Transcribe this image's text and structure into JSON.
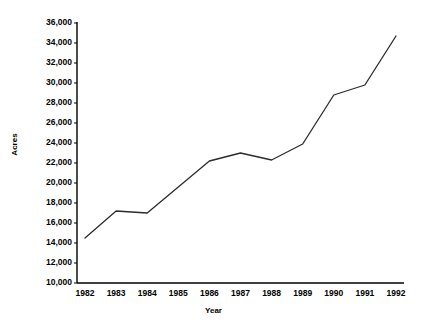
{
  "chart_data": {
    "type": "line",
    "title": "",
    "xlabel": "Year",
    "ylabel": "Acres",
    "categories": [
      "1982",
      "1983",
      "1984",
      "1985",
      "1986",
      "1987",
      "1988",
      "1989",
      "1990",
      "1991",
      "1992"
    ],
    "x": [
      1982,
      1983,
      1984,
      1985,
      1986,
      1987,
      1988,
      1989,
      1990,
      1991,
      1992
    ],
    "values": [
      14500,
      17200,
      17000,
      19600,
      22200,
      23000,
      22300,
      23900,
      28800,
      29800,
      34700
    ],
    "series": [
      {
        "name": "Acres",
        "values": [
          14500,
          17200,
          17000,
          19600,
          22200,
          23000,
          22300,
          23900,
          28800,
          29800,
          34700
        ]
      }
    ],
    "ylim": [
      10000,
      36000
    ],
    "xlim": [
      1982,
      1992
    ],
    "ytick_step": 2000,
    "ytick_labels": [
      "36,000",
      "34,000",
      "32,000",
      "30,000",
      "28,000",
      "26,000",
      "24,000",
      "22,000",
      "20,000",
      "18,000",
      "16,000",
      "14,000",
      "12,000",
      "10,000"
    ],
    "ytick_values": [
      36000,
      34000,
      32000,
      30000,
      28000,
      26000,
      24000,
      22000,
      20000,
      18000,
      16000,
      14000,
      12000,
      10000
    ],
    "xtick_labels": [
      "1982",
      "1983",
      "1984",
      "1985",
      "1986",
      "1987",
      "1988",
      "1989",
      "1990",
      "1991",
      "1992"
    ],
    "grid": false,
    "legend": false,
    "legend_position": "none",
    "line_color": "#2b2b2b",
    "axis_color": "#000000",
    "background_color": "#ffffff"
  }
}
